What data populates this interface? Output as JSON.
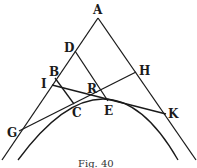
{
  "figure": {
    "caption": "Fig. 40",
    "labels": {
      "A": "A",
      "D": "D",
      "B": "B",
      "I": "I",
      "G": "G",
      "C": "C",
      "R": "R",
      "E": "E",
      "H": "H",
      "K": "K"
    }
  }
}
